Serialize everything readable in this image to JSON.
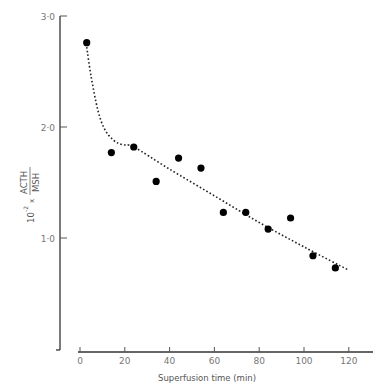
{
  "chart_data": {
    "type": "scatter",
    "title": "",
    "xlabel": "Superfusion time (min)",
    "ylabel": "10^-2 x ACTH/MSH",
    "ylabel_parts": {
      "prefix": "10",
      "exponent": "-2",
      "times": "x",
      "numerator": "ACTH",
      "denominator": "MSH"
    },
    "xlim": [
      0,
      130
    ],
    "ylim": [
      0,
      3.0
    ],
    "x_ticks": [
      0,
      20,
      40,
      60,
      80,
      100,
      120
    ],
    "x_tick_labels": [
      "0",
      "20",
      "40",
      "60",
      "80",
      "100",
      "120"
    ],
    "y_ticks": [
      1.0,
      2.0,
      3.0
    ],
    "y_tick_labels": [
      "1·0",
      "2·0",
      "3·0"
    ],
    "grid": false,
    "legend": null,
    "series": [
      {
        "name": "observations",
        "marker": "filled-circle",
        "x": [
          3,
          14,
          24,
          34,
          44,
          54,
          64,
          74,
          84,
          94,
          104,
          114
        ],
        "y": [
          2.76,
          1.77,
          1.82,
          1.51,
          1.72,
          1.63,
          1.23,
          1.23,
          1.08,
          1.18,
          0.84,
          0.73
        ]
      },
      {
        "name": "fitted curve",
        "style": "dotted",
        "x": [
          3,
          5,
          8,
          11,
          15,
          19,
          24,
          40,
          60,
          80,
          100,
          120
        ],
        "y": [
          2.72,
          2.45,
          2.15,
          1.98,
          1.88,
          1.84,
          1.82,
          1.62,
          1.38,
          1.14,
          0.92,
          0.71
        ]
      }
    ]
  }
}
